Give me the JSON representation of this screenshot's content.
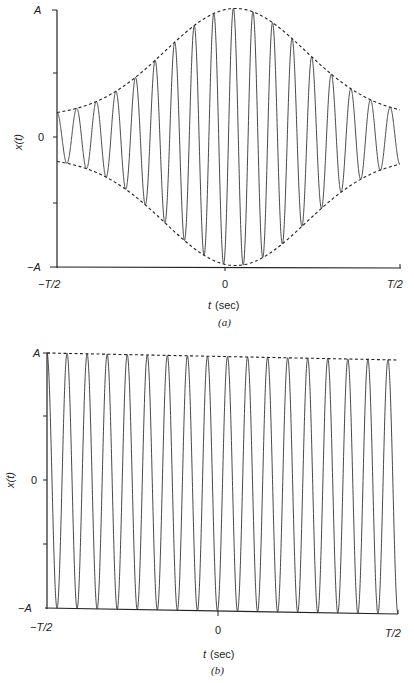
{
  "chart_data": [
    {
      "id": "a",
      "type": "line",
      "caption": "(a)",
      "title": "",
      "xlabel": "t (sec)",
      "ylabel": "x(t)",
      "x_ticks": [
        "-T/2",
        "0",
        "T/2"
      ],
      "y_ticks": [
        "-A",
        "0",
        "A"
      ],
      "xlim": [
        -0.5,
        0.5
      ],
      "ylim": [
        -1,
        1
      ],
      "description": "Gaussian-windowed sinusoid (tone burst): amplitude envelope rises from ~0.2A at -T/2 to A near t=0 and decays back to ~0.2A at T/2",
      "series": [
        {
          "name": "x(t)",
          "style": "solid",
          "cycles": 17,
          "envelope_peak_t": 0.02,
          "peak_values": [
            0.2,
            0.24,
            0.33,
            0.45,
            0.62,
            0.76,
            0.87,
            0.95,
            0.99,
            1.0,
            0.97,
            0.9,
            0.79,
            0.65,
            0.49,
            0.35,
            0.25,
            0.2
          ]
        },
        {
          "name": "upper envelope",
          "style": "dashed",
          "shape": "gaussian",
          "x": [
            -0.5,
            -0.25,
            0.0,
            0.02,
            0.25,
            0.5
          ],
          "values": [
            0.2,
            0.58,
            0.99,
            1.0,
            0.6,
            0.2
          ]
        },
        {
          "name": "lower envelope",
          "style": "dashed",
          "shape": "gaussian",
          "x": [
            -0.5,
            -0.25,
            0.0,
            0.02,
            0.25,
            0.5
          ],
          "values": [
            -0.2,
            -0.58,
            -0.99,
            -1.0,
            -0.6,
            -0.2
          ]
        }
      ]
    },
    {
      "id": "b",
      "type": "line",
      "caption": "(b)",
      "title": "",
      "xlabel": "t (sec)",
      "ylabel": "x(t)",
      "x_ticks": [
        "-T/2",
        "0",
        "T/2"
      ],
      "y_ticks": [
        "-A",
        "0",
        "A"
      ],
      "xlim": [
        -0.5,
        0.5
      ],
      "ylim": [
        -1,
        1
      ],
      "description": "Constant-amplitude sinusoid with amplitude A over the interval -T/2 to T/2",
      "series": [
        {
          "name": "x(t)",
          "style": "solid",
          "cycles": 17,
          "amplitude": 1.0
        },
        {
          "name": "upper envelope",
          "style": "dashed",
          "x": [
            -0.5,
            0.5
          ],
          "values": [
            1.0,
            1.0
          ]
        }
      ]
    }
  ],
  "labels": {
    "a": {
      "y_top": "A",
      "y_mid": "0",
      "y_bot": "−A",
      "ylabel": "x(t)",
      "x_left": "−T/2",
      "x_mid": "0",
      "x_right": "T/2",
      "xlabel_var": "t",
      "xlabel_unit": "(sec)",
      "caption": "(a)"
    },
    "b": {
      "y_top": "A",
      "y_mid": "0",
      "y_bot": "−A",
      "ylabel": "x(t)",
      "x_left": "−T/2",
      "x_mid": "0",
      "x_right": "T/2",
      "xlabel_var": "t",
      "xlabel_unit": "(sec)",
      "caption": "(b)"
    }
  },
  "colors": {
    "ink": "#222222",
    "background": "#ffffff"
  }
}
